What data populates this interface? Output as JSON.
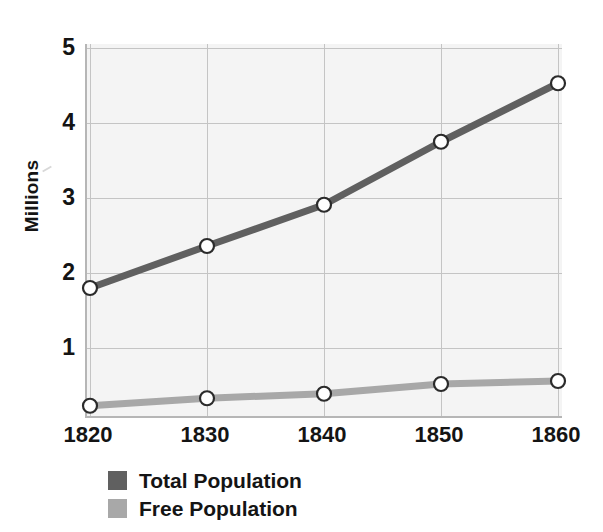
{
  "chart_data": {
    "type": "line",
    "title": "",
    "xlabel": "",
    "ylabel": "Millions",
    "categories": [
      "1820",
      "1830",
      "1840",
      "1850",
      "1860"
    ],
    "x": [
      1820,
      1830,
      1840,
      1850,
      1860
    ],
    "xlim": [
      1820,
      1860
    ],
    "ylim": [
      0,
      5
    ],
    "y_ticks": [
      "1",
      "2",
      "3",
      "4",
      "5"
    ],
    "y_tick_values": [
      1,
      2,
      3,
      4,
      5
    ],
    "grid": true,
    "legend_position": "below-left",
    "series": [
      {
        "name": "Total Population",
        "color": "#606060",
        "marker": "white-circle",
        "values": [
          1.8,
          2.36,
          2.91,
          3.75,
          4.53
        ]
      },
      {
        "name": "Free Population",
        "color": "#a8a8a8",
        "marker": "white-circle",
        "values": [
          0.23,
          0.33,
          0.39,
          0.52,
          0.56
        ]
      }
    ]
  },
  "axis": {
    "y_title": "Millions",
    "y_ticks": [
      {
        "label": "5",
        "value": 5
      },
      {
        "label": "4",
        "value": 4
      },
      {
        "label": "3",
        "value": 3
      },
      {
        "label": "2",
        "value": 2
      },
      {
        "label": "1",
        "value": 1
      }
    ],
    "x_ticks": [
      {
        "label": "1820",
        "value": 1820
      },
      {
        "label": "1830",
        "value": 1830
      },
      {
        "label": "1840",
        "value": 1840
      },
      {
        "label": "1850",
        "value": 1850
      },
      {
        "label": "1860",
        "value": 1860
      }
    ]
  },
  "legend": {
    "items": [
      {
        "label": "Total Population",
        "color": "#606060"
      },
      {
        "label": "Free Population",
        "color": "#a8a8a8"
      }
    ]
  },
  "colors": {
    "total_population": "#606060",
    "free_population": "#a8a8a8",
    "plot_background": "#f4f4f4",
    "gridline": "#c4c4c4",
    "axis_line": "#b6b6b6",
    "text": "#141414",
    "marker_fill": "#ffffff",
    "marker_stroke": "#2b2b2b"
  }
}
